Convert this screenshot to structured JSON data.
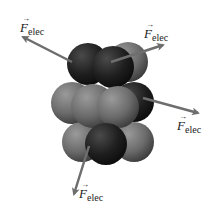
{
  "diagram": {
    "force_symbol": "F",
    "force_subscript": "elec",
    "labels": [
      {
        "id": "top-left",
        "symbol": "F",
        "subscript": "elec"
      },
      {
        "id": "top-right",
        "symbol": "F",
        "subscript": "elec"
      },
      {
        "id": "right",
        "symbol": "F",
        "subscript": "elec"
      },
      {
        "id": "bottom",
        "symbol": "F",
        "subscript": "elec"
      }
    ],
    "colors": {
      "proton": "#1e1e1e",
      "neutron": "#6a6a6a",
      "arrow": "#6e6e6e",
      "background": "#ffffff"
    }
  }
}
